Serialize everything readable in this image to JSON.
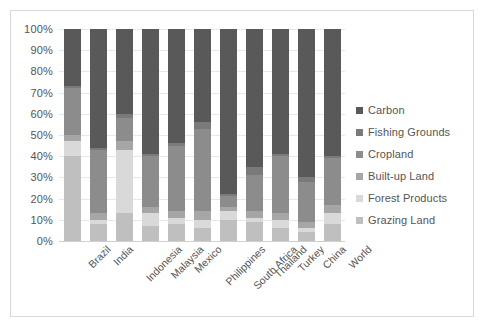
{
  "chart_data": {
    "type": "bar",
    "subtype": "stacked-100-percent",
    "title": "",
    "xlabel": "",
    "ylabel": "",
    "ylim": [
      0,
      100
    ],
    "ytick_labels": [
      "100%",
      "90%",
      "80%",
      "70%",
      "60%",
      "50%",
      "40%",
      "30%",
      "20%",
      "10%",
      "0%"
    ],
    "ytick_values": [
      100,
      90,
      80,
      70,
      60,
      50,
      40,
      30,
      20,
      10,
      0
    ],
    "grid": true,
    "legend_position": "right",
    "stack_order_bottom_to_top": [
      "Grazing Land",
      "Forest Products",
      "Built-up Land",
      "Cropland",
      "Fishing Grounds",
      "Carbon"
    ],
    "categories": [
      "Brazil",
      "India",
      "Indonesia",
      "Malaysia",
      "Mexico",
      "Philippines",
      "South Africa",
      "Thailand",
      "Turkey",
      "China",
      "World"
    ],
    "series": [
      {
        "name": "Carbon",
        "color": "#595959",
        "values": [
          27,
          56,
          40,
          59,
          54,
          44,
          78,
          65,
          59,
          70,
          60
        ]
      },
      {
        "name": "Fishing Grounds",
        "color": "#7a7a7a",
        "values": [
          1,
          1,
          2,
          1,
          1,
          3,
          1,
          4,
          1,
          2,
          1
        ]
      },
      {
        "name": "Cropland",
        "color": "#8c8c8c",
        "values": [
          22,
          30,
          11,
          24,
          31,
          39,
          5,
          17,
          27,
          19,
          22
        ]
      },
      {
        "name": "Built-up Land",
        "color": "#a6a6a6",
        "values": [
          3,
          3,
          4,
          3,
          3,
          4,
          2,
          3,
          3,
          3,
          4
        ]
      },
      {
        "name": "Forest Products",
        "color": "#d9d9d9",
        "values": [
          7,
          2,
          30,
          6,
          3,
          4,
          4,
          2,
          4,
          2,
          5
        ]
      },
      {
        "name": "Grazing Land",
        "color": "#bfbfbf",
        "values": [
          40,
          8,
          13,
          7,
          8,
          6,
          10,
          9,
          6,
          4,
          8
        ]
      }
    ]
  },
  "legend": {
    "items": [
      {
        "label": "Carbon",
        "color": "#595959"
      },
      {
        "label": "Fishing Grounds",
        "color": "#7a7a7a"
      },
      {
        "label": "Cropland",
        "color": "#8c8c8c"
      },
      {
        "label": "Built-up Land",
        "color": "#a6a6a6"
      },
      {
        "label": "Forest Products",
        "color": "#d9d9d9"
      },
      {
        "label": "Grazing Land",
        "color": "#bfbfbf"
      }
    ]
  },
  "colors": {
    "grid": "#e8e8e8",
    "axis_text": "#555555",
    "frame_border": "#d9d9d9",
    "background": "#ffffff"
  }
}
